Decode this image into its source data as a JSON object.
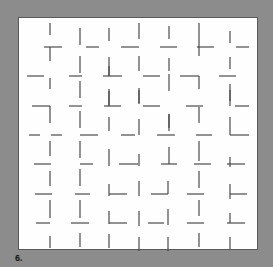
{
  "figure": {
    "label": "6.",
    "background_color": "#8c8c8c",
    "panel_color": "#fefefe",
    "stroke_color": "#4a4a4a",
    "panel": {
      "x": 18,
      "y": 17,
      "width": 240,
      "height": 233
    },
    "strokes": [
      [
        49,
        22,
        49,
        34
      ],
      [
        43,
        46,
        61,
        46
      ],
      [
        49,
        46,
        49,
        60
      ],
      [
        79,
        27,
        79,
        44
      ],
      [
        85,
        46,
        98,
        46
      ],
      [
        79,
        55,
        79,
        72
      ],
      [
        108,
        27,
        108,
        40
      ],
      [
        120,
        46,
        138,
        46
      ],
      [
        108,
        56,
        108,
        75
      ],
      [
        138,
        22,
        138,
        38
      ],
      [
        159,
        46,
        176,
        46
      ],
      [
        138,
        55,
        138,
        70
      ],
      [
        168,
        25,
        168,
        38
      ],
      [
        196,
        46,
        213,
        46
      ],
      [
        168,
        57,
        168,
        70
      ],
      [
        198,
        22,
        198,
        55
      ],
      [
        229,
        30,
        229,
        42
      ],
      [
        235,
        46,
        248,
        46
      ],
      [
        229,
        56,
        229,
        68
      ],
      [
        26,
        75,
        43,
        75
      ],
      [
        49,
        77,
        49,
        88
      ],
      [
        68,
        75,
        81,
        75
      ],
      [
        79,
        80,
        79,
        97
      ],
      [
        102,
        75,
        121,
        75
      ],
      [
        108,
        90,
        108,
        105
      ],
      [
        108,
        65,
        108,
        75
      ],
      [
        142,
        75,
        159,
        75
      ],
      [
        138,
        87,
        138,
        102
      ],
      [
        179,
        75,
        198,
        75
      ],
      [
        198,
        75,
        198,
        88
      ],
      [
        168,
        73,
        168,
        90
      ],
      [
        218,
        75,
        235,
        75
      ],
      [
        229,
        83,
        229,
        100
      ],
      [
        31,
        105,
        49,
        105
      ],
      [
        49,
        105,
        49,
        122
      ],
      [
        68,
        105,
        81,
        105
      ],
      [
        79,
        110,
        79,
        127
      ],
      [
        103,
        105,
        120,
        105
      ],
      [
        108,
        88,
        108,
        105
      ],
      [
        142,
        105,
        159,
        105
      ],
      [
        138,
        89,
        138,
        103
      ],
      [
        185,
        105,
        202,
        105
      ],
      [
        198,
        106,
        198,
        122
      ],
      [
        234,
        105,
        248,
        105
      ],
      [
        229,
        89,
        229,
        105
      ],
      [
        168,
        113,
        168,
        127
      ],
      [
        108,
        116,
        108,
        130
      ],
      [
        28,
        134,
        39,
        134
      ],
      [
        50,
        134,
        61,
        134
      ],
      [
        79,
        134,
        97,
        134
      ],
      [
        120,
        134,
        134,
        134
      ],
      [
        138,
        118,
        138,
        134
      ],
      [
        156,
        134,
        174,
        134
      ],
      [
        168,
        113,
        168,
        130
      ],
      [
        195,
        134,
        211,
        134
      ],
      [
        229,
        116,
        229,
        134
      ],
      [
        229,
        134,
        248,
        134
      ],
      [
        49,
        140,
        49,
        155
      ],
      [
        79,
        140,
        79,
        157
      ],
      [
        33,
        163,
        50,
        163
      ],
      [
        79,
        163,
        92,
        163
      ],
      [
        108,
        148,
        108,
        165
      ],
      [
        118,
        163,
        137,
        163
      ],
      [
        138,
        153,
        138,
        165
      ],
      [
        160,
        163,
        176,
        163
      ],
      [
        168,
        146,
        168,
        163
      ],
      [
        193,
        163,
        210,
        163
      ],
      [
        198,
        140,
        198,
        160
      ],
      [
        226,
        163,
        244,
        163
      ],
      [
        229,
        156,
        229,
        166
      ],
      [
        49,
        170,
        49,
        185
      ],
      [
        79,
        168,
        79,
        185
      ],
      [
        34,
        193,
        51,
        193
      ],
      [
        74,
        193,
        89,
        193
      ],
      [
        108,
        183,
        108,
        195
      ],
      [
        108,
        193,
        126,
        193
      ],
      [
        138,
        180,
        138,
        195
      ],
      [
        150,
        193,
        167,
        193
      ],
      [
        167,
        180,
        167,
        193
      ],
      [
        186,
        193,
        203,
        193
      ],
      [
        198,
        170,
        198,
        187
      ],
      [
        229,
        183,
        229,
        198
      ],
      [
        229,
        193,
        246,
        193
      ],
      [
        49,
        199,
        49,
        217
      ],
      [
        79,
        199,
        79,
        217
      ],
      [
        35,
        222,
        49,
        222
      ],
      [
        70,
        222,
        88,
        222
      ],
      [
        108,
        210,
        108,
        223
      ],
      [
        108,
        222,
        126,
        222
      ],
      [
        138,
        210,
        138,
        225
      ],
      [
        147,
        222,
        163,
        222
      ],
      [
        167,
        208,
        167,
        224
      ],
      [
        186,
        222,
        203,
        222
      ],
      [
        198,
        199,
        198,
        215
      ],
      [
        226,
        222,
        244,
        222
      ],
      [
        229,
        212,
        229,
        222
      ],
      [
        49,
        235,
        49,
        247
      ],
      [
        79,
        232,
        79,
        246
      ],
      [
        108,
        233,
        108,
        247
      ],
      [
        138,
        236,
        138,
        250
      ],
      [
        167,
        236,
        167,
        250
      ],
      [
        198,
        232,
        198,
        246
      ],
      [
        229,
        236,
        229,
        248
      ]
    ]
  }
}
